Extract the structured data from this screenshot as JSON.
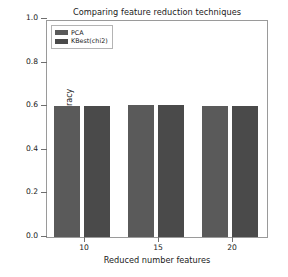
{
  "chart_data": {
    "type": "bar",
    "title": "Comparing feature reduction techniques",
    "xlabel": "Reduced number features",
    "ylabel": "Classification accuracy",
    "categories": [
      "10",
      "15",
      "20"
    ],
    "series": [
      {
        "name": "PCA",
        "color": "#5a5a5a",
        "values": [
          0.6,
          0.605,
          0.6
        ]
      },
      {
        "name": "KBest(chi2)",
        "color": "#4a4a4a",
        "values": [
          0.6,
          0.605,
          0.6
        ]
      }
    ],
    "ylim": [
      0.0,
      1.0
    ],
    "yticks": [
      "0.0",
      "0.2",
      "0.4",
      "0.6",
      "0.8",
      "1.0"
    ],
    "ytick_values": [
      0.0,
      0.2,
      0.4,
      0.6,
      0.8,
      1.0
    ],
    "xticks": [
      "10",
      "15",
      "20"
    ],
    "xtick_values": [
      10,
      15,
      20
    ],
    "xlim": [
      7.5,
      22.5
    ],
    "grid": false,
    "legend_position": "upper left",
    "background": "#ffffff"
  }
}
